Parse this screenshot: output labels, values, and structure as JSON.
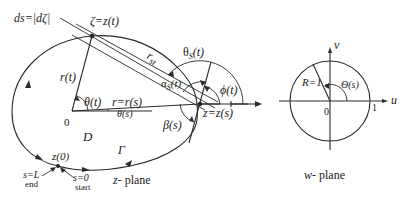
{
  "z_plane": {
    "caption_var": "z",
    "caption_rest": "- plane",
    "labels": {
      "ds": "ds=|dζ|",
      "zeta": "ζ=z(t)",
      "r_st": "r",
      "r_st_sub": "st",
      "theta_s": "θ",
      "theta_s_sub": "S",
      "theta_s_arg": "(t)",
      "alpha_s": "α",
      "alpha_s_sub": "S",
      "alpha_s_arg": "(t)",
      "phi": "ϕ(t)",
      "r_t": "r(t)",
      "theta_t": "θ(t)",
      "r_eq": "r=r(s)",
      "theta_s_small": "θ(s)",
      "z_eq": "z=z(s)",
      "beta": "β(s)",
      "origin": "0",
      "domain": "D",
      "gamma": "Γ",
      "z0": "z(0)",
      "s_end": "s=L",
      "end": "end",
      "s_start": "s=0",
      "start": "start"
    }
  },
  "mapping_arrow": "↦",
  "w_plane": {
    "caption_var": "w",
    "caption_rest": "- plane",
    "labels": {
      "v_axis": "v",
      "u_axis": "u",
      "R": "R=1",
      "Theta": "Θ(s)",
      "origin": "0",
      "one": "1"
    }
  }
}
